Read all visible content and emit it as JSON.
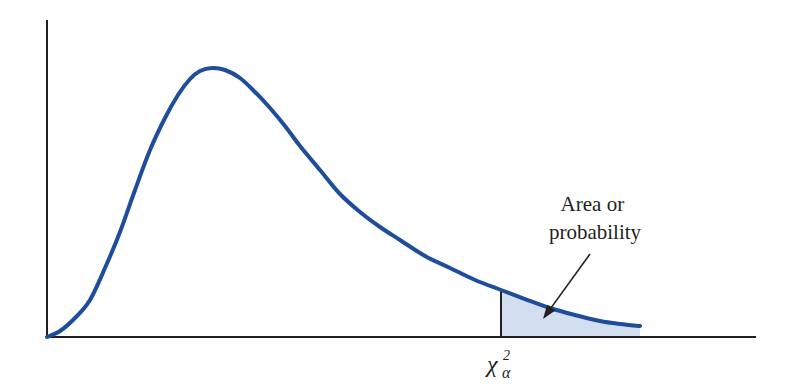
{
  "chart_data": {
    "type": "area",
    "title": "",
    "subtitle": "",
    "xlabel": "",
    "ylabel": "",
    "grid": false,
    "legend": null,
    "x_tick_labels": [
      {
        "label": "χ²_α",
        "symbol": "χ",
        "superscript": "2",
        "subscript": "α",
        "x_px": 501
      }
    ],
    "annotations": [
      {
        "text_lines": [
          "Area or",
          "probability"
        ],
        "arrow_from_px": [
          590,
          254
        ],
        "arrow_to_px": [
          543,
          319
        ]
      }
    ],
    "colors": {
      "curve": "#1e4d9b",
      "shaded_area": "#d3def1",
      "axes": "#231f20",
      "critical_line": "#231f20",
      "arrow": "#231f20",
      "text": "#231f20"
    },
    "axes_px": {
      "origin": [
        47,
        337
      ],
      "x_end": 756,
      "y_top": 20
    },
    "curve_px": [
      [
        47,
        337
      ],
      [
        60,
        331
      ],
      [
        75,
        318
      ],
      [
        90,
        300
      ],
      [
        105,
        268
      ],
      [
        120,
        232
      ],
      [
        135,
        190
      ],
      [
        150,
        150
      ],
      [
        165,
        118
      ],
      [
        178,
        95
      ],
      [
        190,
        79
      ],
      [
        200,
        71
      ],
      [
        212,
        68
      ],
      [
        225,
        70
      ],
      [
        240,
        78
      ],
      [
        255,
        92
      ],
      [
        270,
        108
      ],
      [
        285,
        126
      ],
      [
        300,
        146
      ],
      [
        320,
        170
      ],
      [
        340,
        194
      ],
      [
        360,
        212
      ],
      [
        380,
        227
      ],
      [
        400,
        240
      ],
      [
        425,
        256
      ],
      [
        450,
        268
      ],
      [
        475,
        280
      ],
      [
        501,
        290
      ],
      [
        525,
        299
      ],
      [
        550,
        308
      ],
      [
        575,
        315
      ],
      [
        600,
        321
      ],
      [
        620,
        324
      ],
      [
        640,
        326
      ]
    ],
    "critical_value_x_px": 501,
    "shaded_region": {
      "from_x_px": 501,
      "to_x_px": 640
    }
  },
  "labels": {
    "annotation_line1": "Area or",
    "annotation_line2": "probability",
    "critical_symbol": "χ",
    "critical_superscript": "2",
    "critical_subscript": "α"
  }
}
